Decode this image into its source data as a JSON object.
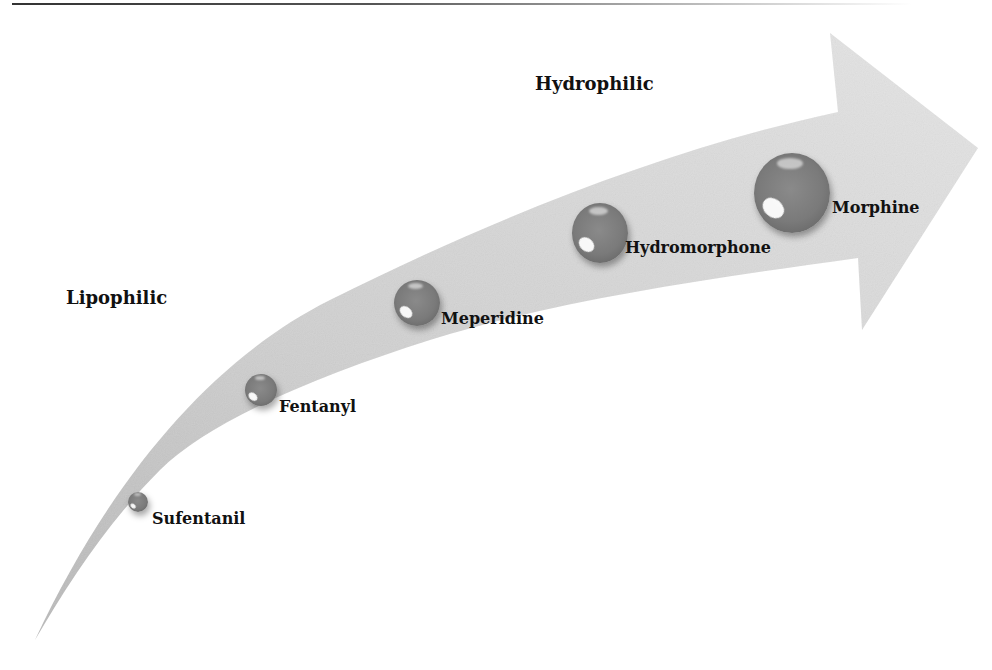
{
  "diagram": {
    "type": "curved-arrow-spectrum",
    "axis_labels": {
      "start": "Lipophilic",
      "end": "Hydrophilic"
    },
    "items": [
      {
        "label": "Sufentanil",
        "order": 1,
        "relative_size": "smallest"
      },
      {
        "label": "Fentanyl",
        "order": 2,
        "relative_size": "small"
      },
      {
        "label": "Meperidine",
        "order": 3,
        "relative_size": "medium"
      },
      {
        "label": "Hydromorphone",
        "order": 4,
        "relative_size": "large"
      },
      {
        "label": "Morphine",
        "order": 5,
        "relative_size": "largest"
      }
    ],
    "colors": {
      "arrow_fill": "#d6d6d6",
      "bubble_fill": "#7a7a7a",
      "text": "#111111",
      "rule": "#3a3a3a"
    }
  }
}
